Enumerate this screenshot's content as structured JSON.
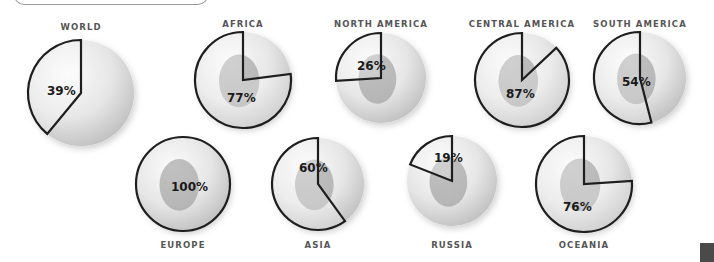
{
  "chart_data": {
    "type": "pie",
    "title": "",
    "start_angle": "12 o'clock, counter-clockwise",
    "items": [
      {
        "region": "WORLD",
        "value": 39,
        "label": "39%",
        "cx": 81,
        "cy": 93,
        "r": 53,
        "label_y": 30,
        "pct_x": 47,
        "pct_y": 95,
        "map": false
      },
      {
        "region": "AFRICA",
        "value": 77,
        "label": "77%",
        "cx": 243,
        "cy": 80,
        "r": 48,
        "label_y": 27,
        "pct_x": 227,
        "pct_y": 102,
        "map": true
      },
      {
        "region": "NORTH AMERICA",
        "value": 26,
        "label": "26%",
        "cx": 381,
        "cy": 78,
        "r": 45,
        "label_y": 27,
        "pct_x": 357,
        "pct_y": 70,
        "map": true
      },
      {
        "region": "CENTRAL AMERICA",
        "value": 87,
        "label": "87%",
        "cx": 522,
        "cy": 80,
        "r": 47,
        "label_y": 27,
        "pct_x": 506,
        "pct_y": 98,
        "map": true
      },
      {
        "region": "SOUTH AMERICA",
        "value": 54,
        "label": "54%",
        "cx": 640,
        "cy": 78,
        "r": 46,
        "label_y": 27,
        "pct_x": 622,
        "pct_y": 86,
        "map": true
      },
      {
        "region": "EUROPE",
        "value": 100,
        "label": "100%",
        "cx": 183,
        "cy": 184,
        "r": 47,
        "label_y": 248,
        "pct_x": 171,
        "pct_y": 191,
        "map": true
      },
      {
        "region": "ASIA",
        "value": 60,
        "label": "60%",
        "cx": 318,
        "cy": 184,
        "r": 46,
        "label_y": 248,
        "pct_x": 299,
        "pct_y": 172,
        "map": true
      },
      {
        "region": "RUSSIA",
        "value": 19,
        "label": "19%",
        "cx": 452,
        "cy": 181,
        "r": 45,
        "label_y": 248,
        "pct_x": 434,
        "pct_y": 162,
        "map": true
      },
      {
        "region": "OCEANIA",
        "value": 76,
        "label": "76%",
        "cx": 584,
        "cy": 184,
        "r": 48,
        "label_y": 248,
        "pct_x": 563,
        "pct_y": 211,
        "map": true
      }
    ],
    "colors": {
      "globe_light": "#f4f4f4",
      "globe_dark": "#c9c9c9",
      "land": "#8f8f8f",
      "wedge_stroke": "#1e1e1e",
      "label": "#555555",
      "percent": "#1a1a1a"
    }
  }
}
